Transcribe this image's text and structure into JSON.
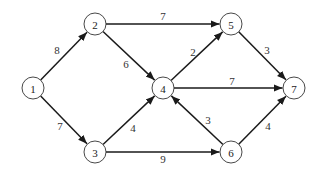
{
  "diagram": {
    "type": "directed-weighted-graph",
    "node_radius": 11,
    "colors": {
      "stroke": "#1a1a1a",
      "node_fill": "#ffffff",
      "text": "#222222"
    },
    "nodes": [
      {
        "id": "1",
        "label": "1",
        "x": 33,
        "y": 88
      },
      {
        "id": "2",
        "label": "2",
        "x": 95,
        "y": 24
      },
      {
        "id": "3",
        "label": "3",
        "x": 95,
        "y": 152
      },
      {
        "id": "4",
        "label": "4",
        "x": 163,
        "y": 88
      },
      {
        "id": "5",
        "label": "5",
        "x": 231,
        "y": 24
      },
      {
        "id": "6",
        "label": "6",
        "x": 231,
        "y": 152
      },
      {
        "id": "7",
        "label": "7",
        "x": 294,
        "y": 88
      }
    ],
    "edges": [
      {
        "from": "1",
        "to": "2",
        "weight": "8",
        "lx": 57,
        "ly": 50
      },
      {
        "from": "1",
        "to": "3",
        "weight": "7",
        "lx": 60,
        "ly": 126
      },
      {
        "from": "2",
        "to": "5",
        "weight": "7",
        "lx": 163,
        "ly": 16
      },
      {
        "from": "2",
        "to": "4",
        "weight": "6",
        "lx": 126,
        "ly": 64
      },
      {
        "from": "3",
        "to": "4",
        "weight": "4",
        "lx": 133,
        "ly": 128
      },
      {
        "from": "3",
        "to": "6",
        "weight": "9",
        "lx": 163,
        "ly": 159
      },
      {
        "from": "4",
        "to": "5",
        "weight": "2",
        "lx": 193,
        "ly": 52
      },
      {
        "from": "4",
        "to": "7",
        "weight": "7",
        "lx": 232,
        "ly": 81
      },
      {
        "from": "6",
        "to": "4",
        "weight": "3",
        "lx": 208,
        "ly": 120
      },
      {
        "from": "5",
        "to": "7",
        "weight": "3",
        "lx": 267,
        "ly": 50
      },
      {
        "from": "6",
        "to": "7",
        "weight": "4",
        "lx": 268,
        "ly": 126
      }
    ]
  }
}
